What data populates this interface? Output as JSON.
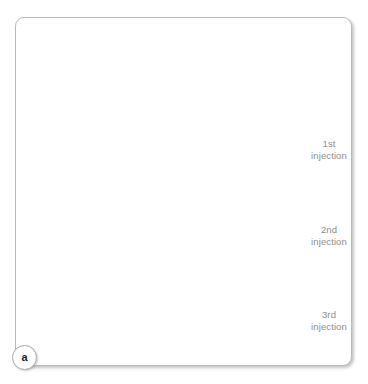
{
  "figure": {
    "domain": "medical-illustration",
    "panel_id": "a",
    "background_color": "#ffffff",
    "frame": {
      "border_color": "#b9b9bd",
      "corner_radius_px": 9,
      "shadow": true
    }
  },
  "labels": [
    {
      "id": "injection-1",
      "line1": "1st",
      "line2": "injection",
      "color": "#8d8d90"
    },
    {
      "id": "injection-2",
      "line1": "2nd",
      "line2": "injection",
      "color": "#8d8d90"
    },
    {
      "id": "injection-3",
      "line1": "3rd",
      "line2": "injection",
      "color": "#8d8d90"
    }
  ],
  "badge": {
    "text": "a",
    "color": "#1d1d1f",
    "border_color": "#a9a9ad"
  },
  "illustration": {
    "line_color": "#2a2a2c",
    "hatch_color": "#5d5d62",
    "convergence_point": {
      "x": 196,
      "y": 247
    },
    "elements": [
      "occipital-hairline-contour",
      "cervical-spinous-processes",
      "paraspinal-muscle-hatching",
      "syringe-upper",
      "syringe-middle",
      "syringe-lower",
      "needle-trajectory-guides"
    ]
  }
}
